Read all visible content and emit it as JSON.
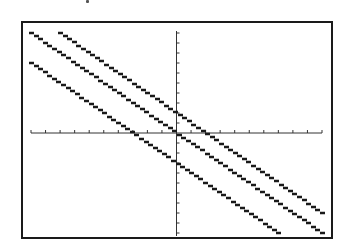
{
  "chart_data": {
    "type": "line",
    "title": "",
    "xlabel": "",
    "ylabel": "",
    "xlim": [
      -10,
      10
    ],
    "ylim": [
      -10,
      10
    ],
    "xscl": 1,
    "yscl": 1,
    "grid": false,
    "legend": null,
    "style": "graphing-calculator pixel plot",
    "series": [
      {
        "name": "y = -x + 2",
        "slope": -1,
        "intercept": 2,
        "x": [
          -8,
          10
        ],
        "y": [
          10,
          -8
        ]
      },
      {
        "name": "y = -x",
        "slope": -1,
        "intercept": 0,
        "x": [
          -10,
          10
        ],
        "y": [
          10,
          -10
        ]
      },
      {
        "name": "y = -x - 3",
        "slope": -1,
        "intercept": -3,
        "x": [
          -10,
          7
        ],
        "y": [
          7,
          -10
        ]
      }
    ]
  },
  "colors": {
    "line": "#1a1a1a",
    "frame": "#1a1a1a",
    "axis": "#333333",
    "background": "#ffffff"
  }
}
